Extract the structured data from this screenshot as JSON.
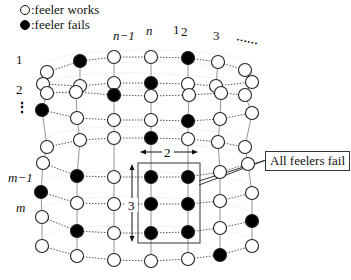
{
  "legend": {
    "works_label": ":feeler works",
    "fails_label": ":feeler fails"
  },
  "column_labels": [
    {
      "text": "n−1",
      "x": 113,
      "y": 38,
      "italic": true
    },
    {
      "text": "n",
      "x": 146,
      "y": 33,
      "italic": true
    },
    {
      "text": "1",
      "x": 173,
      "y": 32,
      "italic": false
    },
    {
      "text": "2",
      "x": 181,
      "y": 34,
      "italic": false
    },
    {
      "text": "3",
      "x": 213,
      "y": 38,
      "italic": false
    }
  ],
  "row_labels": [
    {
      "text": "1",
      "x": 16,
      "y": 62,
      "italic": false
    },
    {
      "text": "2",
      "x": 16,
      "y": 92,
      "italic": false
    },
    {
      "text": "m−1",
      "x": 8,
      "y": 180,
      "italic": true
    },
    {
      "text": "m",
      "x": 16,
      "y": 210,
      "italic": true
    }
  ],
  "ellipsis_top": "……",
  "ellipsis_left": "⋮",
  "bracket_width_label": "2",
  "bracket_height_label": "3",
  "callout_text": "All feelers fail",
  "colors": {
    "stroke": "#222222",
    "fail_fill": "#000000",
    "work_fill": "#ffffff",
    "dotted_line": "#555555"
  },
  "nodes": [
    {
      "x": 47,
      "y": 72,
      "fail": false
    },
    {
      "x": 80,
      "y": 61,
      "fail": true
    },
    {
      "x": 114,
      "y": 57,
      "fail": false
    },
    {
      "x": 151,
      "y": 57,
      "fail": false
    },
    {
      "x": 188,
      "y": 58,
      "fail": true
    },
    {
      "x": 218,
      "y": 62,
      "fail": false
    },
    {
      "x": 245,
      "y": 70,
      "fail": false
    },
    {
      "x": 43,
      "y": 84,
      "fail": false
    },
    {
      "x": 80,
      "y": 86,
      "fail": false
    },
    {
      "x": 114,
      "y": 83,
      "fail": false
    },
    {
      "x": 151,
      "y": 83,
      "fail": true
    },
    {
      "x": 188,
      "y": 84,
      "fail": false
    },
    {
      "x": 216,
      "y": 86,
      "fail": false
    },
    {
      "x": 252,
      "y": 82,
      "fail": false
    },
    {
      "x": 47,
      "y": 93,
      "fail": false
    },
    {
      "x": 76,
      "y": 92,
      "fail": false
    },
    {
      "x": 114,
      "y": 95,
      "fail": true
    },
    {
      "x": 151,
      "y": 96,
      "fail": false
    },
    {
      "x": 189,
      "y": 95,
      "fail": false
    },
    {
      "x": 221,
      "y": 93,
      "fail": false
    },
    {
      "x": 245,
      "y": 95,
      "fail": false
    },
    {
      "x": 42,
      "y": 110,
      "fail": true
    },
    {
      "x": 77,
      "y": 118,
      "fail": false
    },
    {
      "x": 114,
      "y": 120,
      "fail": false
    },
    {
      "x": 151,
      "y": 120,
      "fail": false
    },
    {
      "x": 188,
      "y": 121,
      "fail": true
    },
    {
      "x": 220,
      "y": 119,
      "fail": false
    },
    {
      "x": 252,
      "y": 113,
      "fail": false
    },
    {
      "x": 47,
      "y": 147,
      "fail": false
    },
    {
      "x": 80,
      "y": 140,
      "fail": false
    },
    {
      "x": 114,
      "y": 138,
      "fail": false
    },
    {
      "x": 151,
      "y": 138,
      "fail": true
    },
    {
      "x": 188,
      "y": 139,
      "fail": false
    },
    {
      "x": 218,
      "y": 142,
      "fail": false
    },
    {
      "x": 245,
      "y": 147,
      "fail": false
    },
    {
      "x": 43,
      "y": 163,
      "fail": false
    },
    {
      "x": 77,
      "y": 176,
      "fail": true
    },
    {
      "x": 114,
      "y": 177,
      "fail": false
    },
    {
      "x": 151,
      "y": 177,
      "fail": true
    },
    {
      "x": 188,
      "y": 177,
      "fail": true
    },
    {
      "x": 220,
      "y": 172,
      "fail": false
    },
    {
      "x": 248,
      "y": 164,
      "fail": false
    },
    {
      "x": 41,
      "y": 192,
      "fail": true
    },
    {
      "x": 77,
      "y": 203,
      "fail": false
    },
    {
      "x": 114,
      "y": 204,
      "fail": false
    },
    {
      "x": 151,
      "y": 204,
      "fail": true
    },
    {
      "x": 188,
      "y": 204,
      "fail": true
    },
    {
      "x": 220,
      "y": 201,
      "fail": false
    },
    {
      "x": 252,
      "y": 193,
      "fail": false
    },
    {
      "x": 42,
      "y": 217,
      "fail": false
    },
    {
      "x": 77,
      "y": 231,
      "fail": true
    },
    {
      "x": 114,
      "y": 233,
      "fail": false
    },
    {
      "x": 151,
      "y": 233,
      "fail": true
    },
    {
      "x": 188,
      "y": 232,
      "fail": true
    },
    {
      "x": 220,
      "y": 228,
      "fail": false
    },
    {
      "x": 252,
      "y": 221,
      "fail": true
    },
    {
      "x": 42,
      "y": 246,
      "fail": false
    },
    {
      "x": 77,
      "y": 256,
      "fail": false
    },
    {
      "x": 114,
      "y": 260,
      "fail": false
    },
    {
      "x": 151,
      "y": 261,
      "fail": false
    },
    {
      "x": 188,
      "y": 259,
      "fail": false
    },
    {
      "x": 220,
      "y": 255,
      "fail": true
    },
    {
      "x": 252,
      "y": 246,
      "fail": false
    }
  ],
  "rows": 9,
  "cols": 7
}
